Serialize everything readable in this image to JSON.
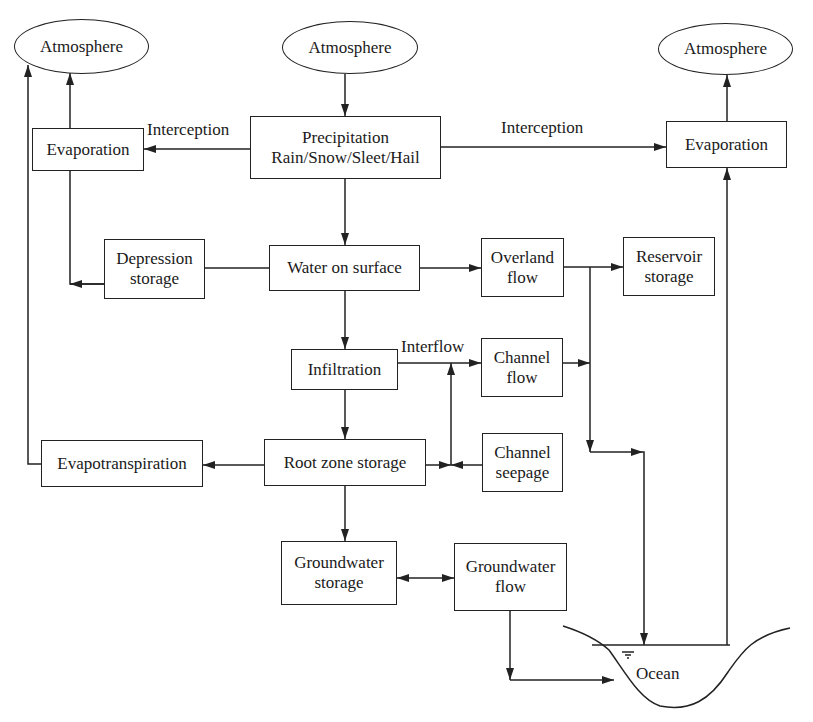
{
  "diagram": {
    "colors": {
      "line": "#222222",
      "background": "#ffffff",
      "text": "#1a1a1a"
    },
    "nodes": {
      "atmosphere_left": {
        "label": "Atmosphere",
        "shape": "ellipse"
      },
      "atmosphere_center": {
        "label": "Atmosphere",
        "shape": "ellipse"
      },
      "atmosphere_right": {
        "label": "Atmosphere",
        "shape": "ellipse"
      },
      "evaporation_left": {
        "label": "Evaporation"
      },
      "precipitation": {
        "line1": "Precipitation",
        "line2": "Rain/Snow/Sleet/Hail"
      },
      "evaporation_right": {
        "label": "Evaporation"
      },
      "depression_storage": {
        "line1": "Depression",
        "line2": "storage"
      },
      "water_on_surface": {
        "label": "Water on surface"
      },
      "overland_flow": {
        "line1": "Overland",
        "line2": "flow"
      },
      "reservoir_storage": {
        "line1": "Reservoir",
        "line2": "storage"
      },
      "infiltration": {
        "label": "Infiltration"
      },
      "channel_flow": {
        "line1": "Channel",
        "line2": "flow"
      },
      "evapotranspiration": {
        "label": "Evapotranspiration"
      },
      "root_zone_storage": {
        "label": "Root zone storage"
      },
      "channel_seepage": {
        "line1": "Channel",
        "line2": "seepage"
      },
      "groundwater_storage": {
        "line1": "Groundwater",
        "line2": "storage"
      },
      "groundwater_flow": {
        "line1": "Groundwater",
        "line2": "flow"
      },
      "ocean": {
        "label": "Ocean",
        "shape": "basin"
      }
    },
    "edge_labels": {
      "interception_left": "Interception",
      "interception_right": "Interception",
      "interflow": "Interflow"
    },
    "edges": [
      {
        "from": "Atmosphere (center)",
        "to": "Precipitation"
      },
      {
        "from": "Precipitation",
        "to": "Evaporation (left)",
        "label": "Interception"
      },
      {
        "from": "Precipitation",
        "to": "Evaporation (right)",
        "label": "Interception"
      },
      {
        "from": "Evaporation (left)",
        "to": "Atmosphere (left)"
      },
      {
        "from": "Evaporation (right)",
        "to": "Atmosphere (right)"
      },
      {
        "from": "Precipitation",
        "to": "Water on surface"
      },
      {
        "from": "Water on surface",
        "to": "Depression storage"
      },
      {
        "from": "Depression storage",
        "to": "Evaporation (left)"
      },
      {
        "from": "Water on surface",
        "to": "Overland flow"
      },
      {
        "from": "Overland flow",
        "to": "Reservoir storage"
      },
      {
        "from": "Overland flow",
        "to": "Ocean"
      },
      {
        "from": "Water on surface",
        "to": "Infiltration"
      },
      {
        "from": "Infiltration",
        "to": "Channel flow",
        "label": "Interflow"
      },
      {
        "from": "Channel flow",
        "to": "Ocean"
      },
      {
        "from": "Infiltration",
        "to": "Root zone storage"
      },
      {
        "from": "Root zone storage",
        "to": "Evapotranspiration"
      },
      {
        "from": "Evapotranspiration",
        "to": "Atmosphere (left)"
      },
      {
        "from": "Root zone storage",
        "to": "Channel flow"
      },
      {
        "from": "Channel seepage",
        "to": "Channel flow"
      },
      {
        "from": "Root zone storage",
        "to": "Groundwater storage"
      },
      {
        "from": "Groundwater storage",
        "to": "Groundwater flow",
        "bidirectional": true
      },
      {
        "from": "Groundwater flow",
        "to": "Ocean"
      },
      {
        "from": "Ocean",
        "to": "Evaporation (right)"
      }
    ]
  }
}
